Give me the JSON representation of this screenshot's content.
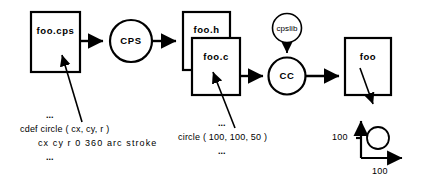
{
  "diagram": {
    "stroke_color": "#000000",
    "background_color": "#ffffff",
    "nodes": {
      "source_file": {
        "label": "foo.cps",
        "shape": "box"
      },
      "cps_compiler": {
        "label": "CPS",
        "shape": "circle"
      },
      "header_file": {
        "label": "foo.h",
        "shape": "box"
      },
      "c_file": {
        "label": "foo.c",
        "shape": "box"
      },
      "cps_library": {
        "label": "cpslib",
        "shape": "circle"
      },
      "c_compiler": {
        "label": "CC",
        "shape": "circle"
      },
      "executable": {
        "label": "foo",
        "shape": "box"
      }
    },
    "annotations": {
      "source_code": {
        "ellipsis_top": "...",
        "line1": "cdef circle ( cx, cy, r )",
        "line2": "cx cy r 0 360 arc stroke",
        "ellipsis_bottom": "..."
      },
      "c_code": {
        "ellipsis_top": "...",
        "line1": "circle ( 100, 100, 50 )",
        "ellipsis_bottom": "..."
      }
    },
    "output_plot": {
      "y_axis_label": "100",
      "x_axis_label": "100",
      "shape": "circle"
    }
  }
}
